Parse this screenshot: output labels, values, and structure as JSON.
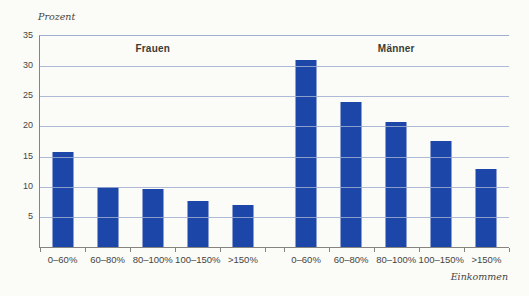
{
  "page": {
    "background": "#fbfbf8"
  },
  "labels": {
    "y_unit": "Prozent",
    "x_unit": "Einkommen"
  },
  "chart_data": {
    "type": "bar",
    "title": "",
    "ylabel": "Prozent",
    "xlabel": "Einkommen",
    "ylim": [
      0,
      35
    ],
    "yticks": [
      35,
      30,
      25,
      20,
      15,
      10,
      5
    ],
    "grid": true,
    "legend_position": "none",
    "bar_color": "#1c47a8",
    "gridline_color": "#9fadd0",
    "axis_color": "#85847f",
    "categories": [
      "0–60%",
      "60–80%",
      "80–100%",
      "100–150%",
      ">150%"
    ],
    "series": [
      {
        "name": "Frauen",
        "values": [
          15.8,
          9.9,
          9.6,
          7.6,
          7.0
        ]
      },
      {
        "name": "Männer",
        "values": [
          31.0,
          24.0,
          20.8,
          17.6,
          13.0
        ]
      }
    ]
  }
}
